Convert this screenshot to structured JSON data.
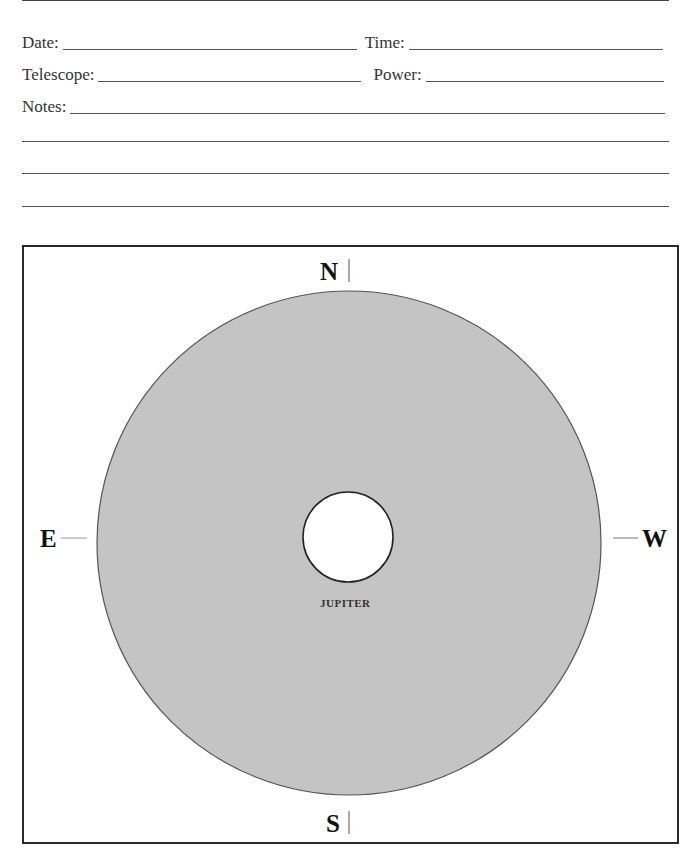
{
  "form": {
    "fields": [
      {
        "label": "Date:",
        "value": ""
      },
      {
        "label": "Time:",
        "value": ""
      },
      {
        "label": "Telescope:",
        "value": ""
      },
      {
        "label": "Power:",
        "value": ""
      },
      {
        "label": "Notes:",
        "value": ""
      }
    ],
    "notes_extra_lines": 3
  },
  "diagram": {
    "planet_label": "JUPITER",
    "directions": {
      "north": "N",
      "south": "S",
      "east": "E",
      "west": "W"
    },
    "colors": {
      "field_fill": "#c4c4c4",
      "field_stroke": "#555555",
      "planet_fill": "#ffffff",
      "planet_stroke": "#222222",
      "frame": "#2a2a2a"
    }
  }
}
